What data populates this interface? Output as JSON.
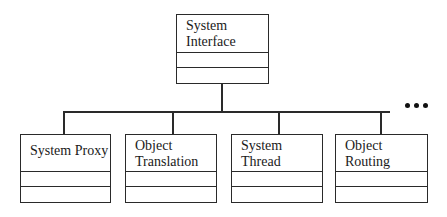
{
  "diagram": {
    "type": "uml-class-hierarchy",
    "root": {
      "name": "System Interface",
      "line1": "System",
      "line2": "Interface"
    },
    "children": [
      {
        "name": "System Proxy",
        "line1": "System Proxy",
        "line2": ""
      },
      {
        "name": "Object Translation",
        "line1": "Object",
        "line2": "Translation"
      },
      {
        "name": "System Thread",
        "line1": "System",
        "line2": "Thread"
      },
      {
        "name": "Object Routing",
        "line1": "Object",
        "line2": "Routing"
      }
    ],
    "continuation": "..."
  }
}
